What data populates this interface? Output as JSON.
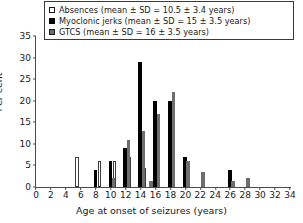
{
  "chart_data": {
    "type": "bar",
    "title": "",
    "xlabel": "Age at onset of seizures (years)",
    "ylabel": "Per cent",
    "xlim": [
      0,
      34
    ],
    "ylim": [
      0,
      35
    ],
    "xticks": [
      0,
      2,
      4,
      6,
      8,
      10,
      12,
      14,
      16,
      18,
      20,
      22,
      24,
      26,
      28,
      30,
      32,
      34
    ],
    "yticks": [
      0,
      5,
      10,
      15,
      20,
      25,
      30,
      35
    ],
    "grid": false,
    "legend_position": "top-center",
    "x": [
      6,
      8,
      9,
      10,
      11,
      12,
      13,
      14,
      15,
      16,
      17,
      18,
      19,
      20,
      21,
      22,
      26,
      27,
      28
    ],
    "series": [
      {
        "name": "Absences",
        "label": "Absences (mean ± SD = 10.5 ± 3.4 years)",
        "swatch": "open-square",
        "color": "#ffffff",
        "mean": 10.5,
        "sd": 3.4,
        "points": [
          {
            "age": 6,
            "value": 7
          },
          {
            "age": 9,
            "value": 6
          },
          {
            "age": 11,
            "value": 6
          },
          {
            "age": 13,
            "value": 7
          },
          {
            "age": 15,
            "value": 4.5
          }
        ]
      },
      {
        "name": "Myoclonic jerks",
        "label": "Myoclonic jerks (mean ± SD = 15 ± 3.5 years)",
        "swatch": "filled-square",
        "color": "#000000",
        "mean": 15,
        "sd": 3.5,
        "points": [
          {
            "age": 8,
            "value": 4
          },
          {
            "age": 10,
            "value": 6
          },
          {
            "age": 12,
            "value": 9
          },
          {
            "age": 14,
            "value": 29
          },
          {
            "age": 16,
            "value": 20
          },
          {
            "age": 18,
            "value": 20
          },
          {
            "age": 20,
            "value": 7
          },
          {
            "age": 26,
            "value": 4
          }
        ]
      },
      {
        "name": "GTCS",
        "label": "GTCS (mean ± SD = 16 ± 3.5 years)",
        "swatch": "grey-square",
        "color": "#6e6e6e",
        "mean": 16,
        "sd": 3.5,
        "points": [
          {
            "age": 10,
            "value": 2
          },
          {
            "age": 12,
            "value": 11
          },
          {
            "age": 14,
            "value": 13
          },
          {
            "age": 15,
            "value": 1.5
          },
          {
            "age": 16,
            "value": 17
          },
          {
            "age": 18,
            "value": 22
          },
          {
            "age": 20,
            "value": 6
          },
          {
            "age": 22,
            "value": 3.5
          },
          {
            "age": 26,
            "value": 1.5
          },
          {
            "age": 28,
            "value": 2
          }
        ]
      }
    ]
  }
}
